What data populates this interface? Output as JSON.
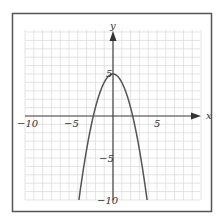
{
  "chart_data": {
    "type": "line",
    "title": "",
    "xlabel": "x",
    "ylabel": "y",
    "xlim": [
      -10,
      10
    ],
    "ylim": [
      -10,
      10
    ],
    "grid": true,
    "x_tick_labels": [
      "-10",
      "-5",
      "5"
    ],
    "y_tick_labels": [
      "5",
      "-5",
      "-10"
    ],
    "series": [
      {
        "name": "y = 5 - x^2",
        "equation": "y = 5 - x^2",
        "x": [
          -3.87,
          -3,
          -2,
          -1,
          0,
          1,
          2,
          3,
          3.87
        ],
        "y": [
          -10,
          -4,
          1,
          4,
          5,
          4,
          1,
          -4,
          -10
        ]
      }
    ],
    "vertex": [
      0,
      5
    ]
  },
  "colors": {
    "frame": "#555555",
    "grid": "#d8d8d8",
    "axis": "#444444",
    "curve": "#555555"
  },
  "labels": {
    "x_axis": "x",
    "y_axis": "y",
    "x_neg10": "−10",
    "x_neg5": "−5",
    "x_5": "5",
    "y_5": "5",
    "y_neg5": "−5",
    "y_neg10": "−10"
  }
}
